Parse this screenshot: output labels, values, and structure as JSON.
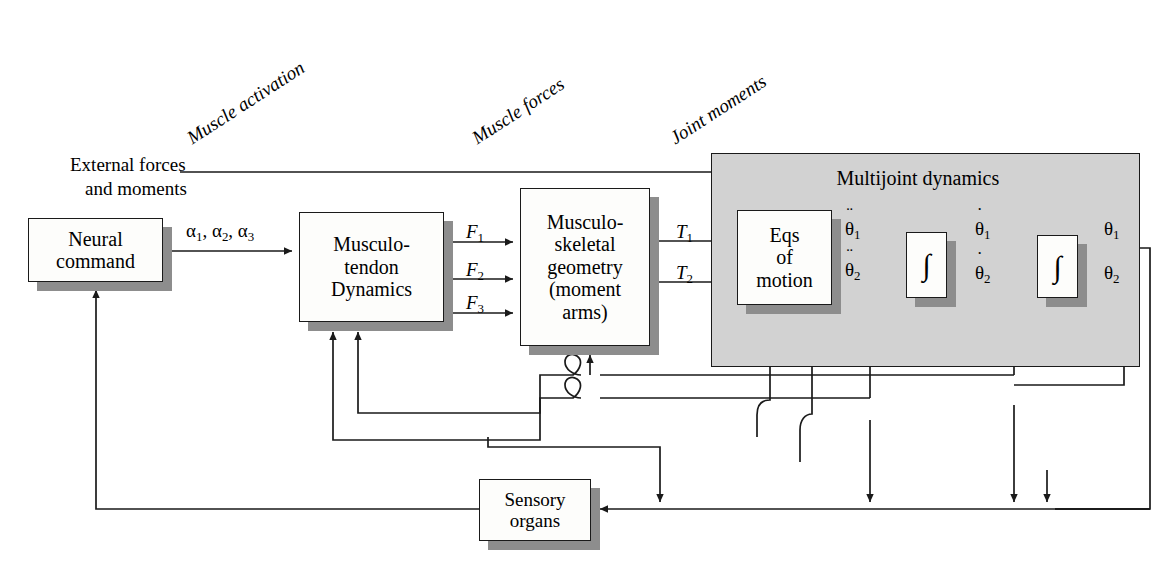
{
  "diagram": {
    "colors": {
      "panel_fill": "#d2d2d2",
      "box_fill": "#fdfdfb",
      "shadow": "#8d8d8d",
      "stroke": "#1a1a1a",
      "background": "#ffffff"
    }
  },
  "stage_labels": [
    {
      "id": "muscle-activation",
      "text": "Muscle activation",
      "x": 195,
      "y": 127,
      "rotate": -33
    },
    {
      "id": "muscle-forces",
      "text": "Muscle forces",
      "x": 480,
      "y": 127,
      "rotate": -33
    },
    {
      "id": "joint-moments",
      "text": "Joint moments",
      "x": 678,
      "y": 127,
      "rotate": -33
    }
  ],
  "panel": {
    "label": "Multijoint dynamics",
    "x": 711,
    "y": 153,
    "w": 427,
    "h": 212
  },
  "blocks": [
    {
      "id": "neural-command",
      "lines": [
        "Neural",
        "command"
      ],
      "x": 28,
      "y": 218,
      "w": 135,
      "h": 64,
      "font": 20
    },
    {
      "id": "musculotendon",
      "lines": [
        "Musculo-",
        "tendon",
        "Dynamics"
      ],
      "x": 299,
      "y": 212,
      "w": 145,
      "h": 110,
      "font": 20
    },
    {
      "id": "msk-geometry",
      "lines": [
        "Musculo-",
        "skeletal",
        "geometry",
        "(moment",
        "arms)"
      ],
      "x": 520,
      "y": 188,
      "w": 130,
      "h": 158,
      "font": 20
    },
    {
      "id": "eqs-of-motion",
      "lines": [
        "Eqs",
        "of",
        "motion"
      ],
      "x": 737,
      "y": 210,
      "w": 95,
      "h": 95,
      "font": 20
    },
    {
      "id": "integrator-1",
      "lines": [
        "∫"
      ],
      "x": 906,
      "y": 232,
      "w": 41,
      "h": 66,
      "font": 30
    },
    {
      "id": "integrator-2",
      "lines": [
        "∫"
      ],
      "x": 1037,
      "y": 235,
      "w": 41,
      "h": 63,
      "font": 30
    },
    {
      "id": "sensory-organs",
      "lines": [
        "Sensory",
        "organs"
      ],
      "x": 479,
      "y": 479,
      "w": 112,
      "h": 62,
      "font": 19
    }
  ],
  "signal_labels": [
    {
      "id": "external-forces-line1",
      "text": "External forces",
      "x": 70,
      "y": 154,
      "italic": false,
      "font": 19
    },
    {
      "id": "external-forces-line2",
      "text": "and moments",
      "x": 85,
      "y": 178,
      "italic": false,
      "font": 19
    },
    {
      "id": "alpha-inputs",
      "html": "α<sub class=\"sub\">1</sub>, α<sub class=\"sub\">2</sub>, α<sub class=\"sub\">3</sub>",
      "x": 186,
      "y": 220,
      "font": 19
    },
    {
      "id": "force-1",
      "html": "<i>F</i><sub class=\"sub\">1</sub>",
      "x": 466,
      "y": 221,
      "font": 19
    },
    {
      "id": "force-2",
      "html": "<i>F</i><sub class=\"sub\">2</sub>",
      "x": 466,
      "y": 259,
      "font": 19
    },
    {
      "id": "force-3",
      "html": "<i>F</i><sub class=\"sub\">3</sub>",
      "x": 466,
      "y": 292,
      "font": 19
    },
    {
      "id": "torque-1",
      "html": "<i>T</i><sub class=\"sub\">1</sub>",
      "x": 676,
      "y": 221,
      "font": 19
    },
    {
      "id": "torque-2",
      "html": "<i>T</i><sub class=\"sub\">2</sub>",
      "x": 676,
      "y": 262,
      "font": 19
    },
    {
      "id": "accel-1",
      "html": "<span class=\"ovd\">θ<span class=\"dots\" style=\"top:-0.78em\">¨</span></span><sub class=\"sub\">1</sub>",
      "x": 845,
      "y": 218,
      "font": 19
    },
    {
      "id": "accel-2",
      "html": "<span class=\"ovd\">θ<span class=\"dots\" style=\"top:-0.78em\">¨</span></span><sub class=\"sub\">2</sub>",
      "x": 845,
      "y": 259,
      "font": 19
    },
    {
      "id": "vel-1",
      "html": "<span class=\"ovd\">θ<span class=\"dots\" style=\"top:-0.72em\">˙</span></span><sub class=\"sub\">1</sub>",
      "x": 975,
      "y": 218,
      "font": 19
    },
    {
      "id": "vel-2",
      "html": "<span class=\"ovd\">θ<span class=\"dots\" style=\"top:-0.72em\">˙</span></span><sub class=\"sub\">2</sub>",
      "x": 975,
      "y": 262,
      "font": 19
    },
    {
      "id": "angle-1",
      "html": "θ<sub class=\"sub\">1</sub>",
      "x": 1104,
      "y": 218,
      "font": 19
    },
    {
      "id": "angle-2",
      "html": "θ<sub class=\"sub\">2</sub>",
      "x": 1104,
      "y": 262,
      "font": 19
    }
  ],
  "signals": {
    "forward_chain": [
      "Neural command",
      "Musculo-tendon Dynamics",
      "Musculo-skeletal geometry (moment arms)",
      "Eqs of motion",
      "integrator",
      "integrator"
    ],
    "feedback_source": "Sensory organs",
    "feedback_target": "Neural command",
    "external_input": "External forces and moments"
  }
}
